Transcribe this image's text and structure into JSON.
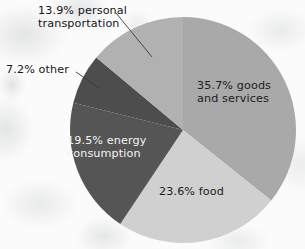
{
  "chart_data": {
    "type": "pie",
    "title": "",
    "subtitle": "",
    "xlabel": "",
    "ylabel": "",
    "legend_position": "none",
    "grid": false,
    "units": "percent",
    "total": 99.9,
    "categories": [
      "goods and services",
      "food",
      "energy consumption",
      "other",
      "personal transportation"
    ],
    "values": [
      35.7,
      23.6,
      19.5,
      7.2,
      13.9
    ],
    "colors": [
      "#a9a9a9",
      "#d0d0d0",
      "#555555",
      "#4d4d4d",
      "#b1b1b1"
    ],
    "slices": [
      {
        "id": "goods",
        "label": "35.7% goods\nand services",
        "percent_text": "35.7%",
        "name": "goods and services",
        "value": 35.7,
        "color": "#a9a9a9",
        "label_placement": "inside",
        "label_color": "dark-text"
      },
      {
        "id": "food",
        "label": "23.6% food",
        "percent_text": "23.6%",
        "name": "food",
        "value": 23.6,
        "color": "#d0d0d0",
        "label_placement": "inside",
        "label_color": "dark-text"
      },
      {
        "id": "energy",
        "label": "19.5% energy\nconsumption",
        "percent_text": "19.5%",
        "name": "energy consumption",
        "value": 19.5,
        "color": "#555555",
        "label_placement": "inside",
        "label_color": "light-text"
      },
      {
        "id": "other",
        "label": "7.2% other",
        "percent_text": "7.2%",
        "name": "other",
        "value": 7.2,
        "color": "#4d4d4d",
        "label_placement": "outside",
        "label_color": "dark-text"
      },
      {
        "id": "transportation",
        "label": "13.9% personal\ntransportation",
        "percent_text": "13.9%",
        "name": "personal transportation",
        "value": 13.9,
        "color": "#b1b1b1",
        "label_placement": "outside",
        "label_color": "dark-text"
      }
    ],
    "geometry": {
      "center_x": 183,
      "center_y": 130,
      "radius": 113,
      "start_angle_deg": 0,
      "direction": "clockwise"
    },
    "leader_lines": [
      {
        "id": "transportation-leader",
        "x1": 116,
        "y1": 13,
        "x2": 152,
        "y2": 57
      },
      {
        "id": "other-leader",
        "x1": 76,
        "y1": 72,
        "x2": 99,
        "y2": 88
      }
    ]
  },
  "figure": {
    "background_color": "#fbfbfb",
    "background_style": "mottled-cloud-texture"
  }
}
